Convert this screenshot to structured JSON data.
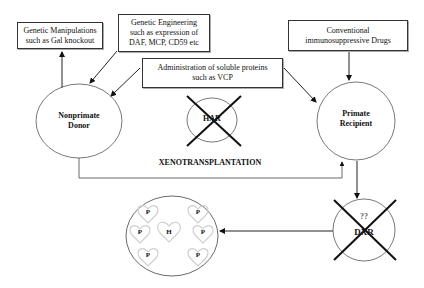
{
  "diagram": {
    "title": "XENOTRANSPLANTATION",
    "boxes": {
      "genetic_manipulations": {
        "line1": "Genetic Manipulations",
        "line2": "such as Gal knockout"
      },
      "genetic_engineering": {
        "line1": "Genetic Engineering",
        "line2": "such as expression of",
        "line3": "DAF, MCP, CD59 etc"
      },
      "soluble_proteins": {
        "line1": "Administration of soluble proteins",
        "line2": "such as VCP"
      },
      "immunosuppressive": {
        "line1": "Conventional",
        "line2": "immunosuppressive Drugs"
      }
    },
    "nodes": {
      "donor": {
        "line1": "Nonprimate",
        "line2": "Donor"
      },
      "recipient": {
        "line1": "Primate",
        "line2": "Recipient"
      },
      "har": {
        "label": "HAR",
        "crossed": true
      },
      "dxr": {
        "top": "??",
        "label": "DXR",
        "crossed": true
      },
      "outcome": {
        "center_heart": "H",
        "surrounding_hearts": [
          "P",
          "P",
          "P",
          "P",
          "P",
          "P"
        ]
      }
    },
    "colors": {
      "line": "#222222",
      "circle": "#555555",
      "cross": "#111111",
      "heart": "#cccccc"
    }
  }
}
